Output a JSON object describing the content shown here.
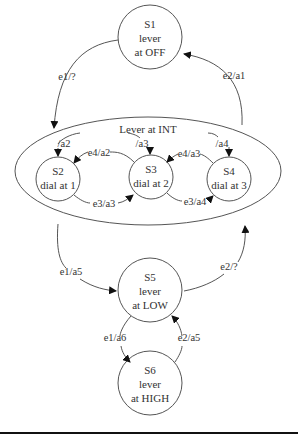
{
  "diagram": {
    "type": "state-machine",
    "states": [
      {
        "id": "S1",
        "line1": "S1",
        "line2": "lever",
        "line3": "at OFF"
      },
      {
        "id": "S2",
        "line1": "S2",
        "line2": "dial at 1"
      },
      {
        "id": "S3",
        "line1": "S3",
        "line2": "dial at 2"
      },
      {
        "id": "S4",
        "line1": "S4",
        "line2": "dial at 3"
      },
      {
        "id": "S5",
        "line1": "S5",
        "line2": "lever",
        "line3": "at LOW"
      },
      {
        "id": "S6",
        "line1": "S6",
        "line2": "lever",
        "line3": "at HIGH"
      }
    ],
    "superstate": {
      "label": "Lever at INT"
    },
    "transitions": [
      {
        "from": "S1",
        "to": "Lever at INT",
        "label": "e1/?"
      },
      {
        "from": "Lever at INT",
        "to": "S1",
        "label": "e2/a1"
      },
      {
        "from": "entry",
        "to": "S2",
        "label": "/a2"
      },
      {
        "from": "entry",
        "to": "S3",
        "label": "/a3"
      },
      {
        "from": "entry",
        "to": "S4",
        "label": "/a4"
      },
      {
        "from": "S3",
        "to": "S2",
        "label": "e4/a2"
      },
      {
        "from": "S2",
        "to": "S3",
        "label": "e3/a3"
      },
      {
        "from": "S4",
        "to": "S3",
        "label": "e4/a3"
      },
      {
        "from": "S3",
        "to": "S4",
        "label": "e3/a4"
      },
      {
        "from": "Lever at INT",
        "to": "S5",
        "label": "e1/a5"
      },
      {
        "from": "S5",
        "to": "Lever at INT",
        "label": "e2/?"
      },
      {
        "from": "S5",
        "to": "S6",
        "label": "e1/a6"
      },
      {
        "from": "S6",
        "to": "S5",
        "label": "e2/a5"
      }
    ]
  }
}
